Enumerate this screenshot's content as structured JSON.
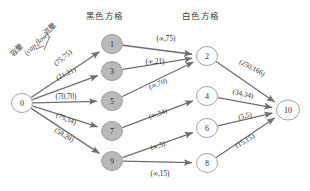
{
  "headers": {
    "black_group": "黑色方格",
    "white_group": "白色方格"
  },
  "legend": {
    "capacity_label": "容量",
    "flow_label": "流量",
    "pair_label": "(cap,flow)"
  },
  "nodes": [
    {
      "id": "0",
      "label": "0",
      "style": "white",
      "cx": 22,
      "cy": 103,
      "rx": 10.5,
      "ry": 9.5
    },
    {
      "id": "1",
      "label": "1",
      "style": "black",
      "cx": 112,
      "cy": 44,
      "rx": 10.5,
      "ry": 9.5
    },
    {
      "id": "3",
      "label": "3",
      "style": "black",
      "cx": 112,
      "cy": 71,
      "rx": 10.5,
      "ry": 9.5
    },
    {
      "id": "5",
      "label": "5",
      "style": "black",
      "cx": 112,
      "cy": 101,
      "rx": 10.5,
      "ry": 9.5
    },
    {
      "id": "7",
      "label": "7",
      "style": "black",
      "cx": 112,
      "cy": 131,
      "rx": 10.5,
      "ry": 9.5
    },
    {
      "id": "9",
      "label": "9",
      "style": "black",
      "cx": 112,
      "cy": 161,
      "rx": 10.5,
      "ry": 9.5
    },
    {
      "id": "2",
      "label": "2",
      "style": "white",
      "cx": 207,
      "cy": 56,
      "rx": 10.5,
      "ry": 9.5
    },
    {
      "id": "4",
      "label": "4",
      "style": "white",
      "cx": 207,
      "cy": 96,
      "rx": 10.5,
      "ry": 9.5
    },
    {
      "id": "6",
      "label": "6",
      "style": "white",
      "cx": 207,
      "cy": 128,
      "rx": 10.5,
      "ry": 9.5
    },
    {
      "id": "8",
      "label": "8",
      "style": "white",
      "cx": 207,
      "cy": 163,
      "rx": 10.5,
      "ry": 9.5
    },
    {
      "id": "10",
      "label": "10",
      "style": "white",
      "cx": 288,
      "cy": 110,
      "rx": 11.5,
      "ry": 10
    }
  ],
  "edges": [
    {
      "from": "0",
      "to": "1",
      "label": "(75,75)",
      "lx": 63,
      "ly": 58,
      "rot": -40
    },
    {
      "from": "0",
      "to": "3",
      "label": "(21,21)",
      "lx": 66,
      "ly": 74,
      "rot": -26
    },
    {
      "from": "0",
      "to": "5",
      "label": "(70,70)",
      "lx": 66,
      "ly": 97,
      "rot": 0
    },
    {
      "from": "0",
      "to": "7",
      "label": "(75,34)",
      "lx": 66,
      "ly": 119,
      "rot": 22
    },
    {
      "from": "0",
      "to": "9",
      "label": "(58,20)",
      "lx": 64,
      "ly": 135,
      "rot": 31
    },
    {
      "from": "1",
      "to": "2",
      "label": "(∞,75)",
      "lx": 166,
      "ly": 39,
      "rot": 0
    },
    {
      "from": "3",
      "to": "2",
      "label": "(∞,21)",
      "lx": 155,
      "ly": 62,
      "rot": 0
    },
    {
      "from": "5",
      "to": "2",
      "label": "(∞,70)",
      "lx": 158,
      "ly": 84,
      "rot": -22
    },
    {
      "from": "7",
      "to": "4",
      "label": "(∞,34)",
      "lx": 158,
      "ly": 114,
      "rot": -20
    },
    {
      "from": "9",
      "to": "6",
      "label": "(∞,5)",
      "lx": 158,
      "ly": 146,
      "rot": -18
    },
    {
      "from": "9",
      "to": "8",
      "label": "(∞,15)",
      "lx": 160,
      "ly": 174,
      "rot": 0
    },
    {
      "from": "2",
      "to": "10",
      "label": "(250,166)",
      "lx": 252,
      "ly": 68,
      "rot": 28
    },
    {
      "from": "4",
      "to": "10",
      "label": "(34,34)",
      "lx": 243,
      "ly": 94,
      "rot": 12
    },
    {
      "from": "6",
      "to": "10",
      "label": "(5,5)",
      "lx": 245,
      "ly": 116,
      "rot": -12
    },
    {
      "from": "8",
      "to": "10",
      "label": "(15,15)",
      "lx": 245,
      "ly": 141,
      "rot": -31
    }
  ],
  "colors": {
    "black_node_fill": "#b9b9b9",
    "white_node_fill": "#ffffff",
    "edge_stroke": "#6e6e6e",
    "text": "#2b2b2b"
  }
}
